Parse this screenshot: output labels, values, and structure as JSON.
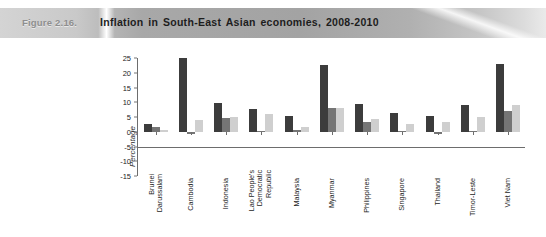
{
  "header": {
    "figure_number": "Figure 2.16.",
    "title": "Inflation in South-East Asian economies, 2008-2010"
  },
  "chart_data": {
    "type": "bar",
    "title": "Inflation in South-East Asian economies, 2008-2010",
    "xlabel": "",
    "ylabel": "Percentage",
    "ylim": [
      -15,
      25
    ],
    "yticks": [
      25,
      20,
      15,
      10,
      5,
      0,
      -5,
      -10,
      -15
    ],
    "grid": false,
    "legend_position": "bottom",
    "categories": [
      "Brunei Darussalam",
      "Cambodia",
      "Indonesia",
      "Lao People's Democratic Republic",
      "Malaysia",
      "Myanmar",
      "Philippines",
      "Singapore",
      "Thailand",
      "Timor-Leste",
      "Viet Nam"
    ],
    "category_lines": [
      [
        "Brunei",
        "Darussalam"
      ],
      [
        "Cambodia"
      ],
      [
        "Indonesia"
      ],
      [
        "Lao People's",
        "Democratic",
        "Republic"
      ],
      [
        "Malaysia"
      ],
      [
        "Myanmar"
      ],
      [
        "Philippines"
      ],
      [
        "Singapore"
      ],
      [
        "Thailand"
      ],
      [
        "Timor-Leste"
      ],
      [
        "Viet Nam"
      ]
    ],
    "series": [
      {
        "name": "2008",
        "color": "#3c3c3c",
        "values": [
          2.7,
          25.0,
          9.8,
          7.6,
          5.4,
          22.5,
          9.3,
          6.5,
          5.5,
          9.0,
          23.1
        ]
      },
      {
        "name": "2009",
        "color": "#757575",
        "values": [
          1.5,
          -0.7,
          4.8,
          0.2,
          0.6,
          8.2,
          3.2,
          0.2,
          -0.9,
          0.3,
          6.9
        ]
      },
      {
        "name": "2010",
        "color": "#cfcfcf",
        "values": [
          0.5,
          4.0,
          5.1,
          6.0,
          1.7,
          8.2,
          4.4,
          2.8,
          3.3,
          5.0,
          9.0
        ]
      }
    ]
  },
  "legend": {
    "items": [
      {
        "label": "2008",
        "color": "#3c3c3c"
      },
      {
        "label": "2009",
        "color": "#757575"
      },
      {
        "label": "2010",
        "color": "#cfcfcf"
      }
    ]
  }
}
